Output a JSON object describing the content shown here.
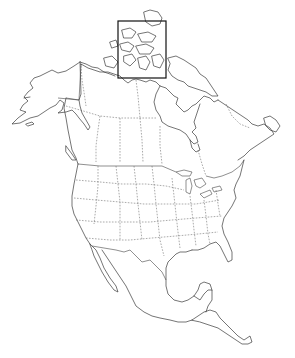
{
  "map": {
    "title": "",
    "region": "North America",
    "style": "outline map with political boundaries",
    "highlight": {
      "shape": "rectangle",
      "area": "Canadian Arctic Archipelago",
      "x": 118,
      "y": 21,
      "width": 48,
      "height": 57
    },
    "colors": {
      "background": "#ffffff",
      "outline": "#3a3a3a",
      "highlight_frame": "#111111"
    }
  }
}
